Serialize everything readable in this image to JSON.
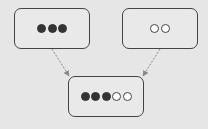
{
  "diagram": {
    "type": "merge",
    "nodes": [
      {
        "id": "left",
        "dots": [
          "filled",
          "filled",
          "filled"
        ],
        "box": {
          "x": 14,
          "y": 8,
          "w": 76,
          "h": 41
        }
      },
      {
        "id": "right",
        "dots": [
          "hollow",
          "hollow"
        ],
        "box": {
          "x": 122,
          "y": 8,
          "w": 76,
          "h": 41
        }
      },
      {
        "id": "result",
        "dots": [
          "filled",
          "filled",
          "filled",
          "hollow",
          "hollow"
        ],
        "box": {
          "x": 68,
          "y": 76,
          "w": 76,
          "h": 41
        }
      }
    ],
    "edges": [
      {
        "from": "left",
        "to": "result",
        "style": "dashed"
      },
      {
        "from": "right",
        "to": "result",
        "style": "dashed"
      }
    ],
    "colors": {
      "background": "#e6e6e6",
      "border": "#444444",
      "filled_dot": "#333333",
      "hollow_dot": "#ffffff",
      "arrow": "#8a8a8a"
    }
  }
}
